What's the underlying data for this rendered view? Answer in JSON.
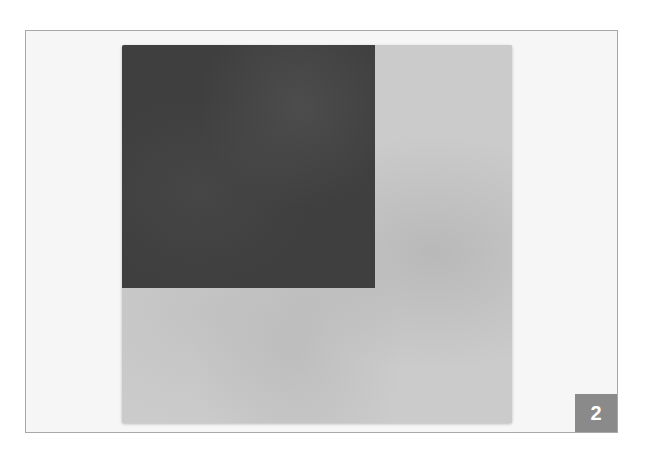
{
  "figure": {
    "badge_number": "2",
    "colors": {
      "frame_border": "#a8a8a8",
      "frame_background": "#f6f6f6",
      "dark_panel": "#3f3f3f",
      "light_panel": "#cbcbcb",
      "badge_background": "#8a8a8a",
      "badge_text": "#ffffff"
    },
    "artwork": {
      "description": "Photograph of a square painting: a dark grey rectangle in the upper-left on a light grey field"
    }
  }
}
